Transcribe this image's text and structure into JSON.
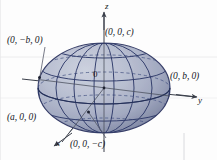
{
  "figure": {
    "kind": "ellipsoid-3d-coordinate-diagram",
    "background_color": "#fdfdfd",
    "surface_color_light": "#c3c8d8",
    "surface_color_mid": "#a7adc4",
    "surface_color_dark": "#6f7794",
    "grid_color": "#2b3a6b",
    "axis_color": "#3a3f4a",
    "text_color": "#14161c",
    "edge_line_color": "#e3e3ea"
  },
  "axes": {
    "z": {
      "label": "z",
      "direction": "up"
    },
    "y": {
      "label": "y",
      "direction": "right"
    },
    "x": {
      "label": "x",
      "direction": "down-left"
    },
    "origin_label": "0"
  },
  "point_labels": {
    "neg_b": "(0, −b, 0)",
    "pos_c": "(0, 0, c)",
    "pos_b": "(0, b, 0)",
    "pos_a": "(a, 0, 0)",
    "neg_c": "(0, 0, −c)"
  },
  "geometry": {
    "center": {
      "cx": 104,
      "cy": 88
    },
    "semi_axis_horizontal": 66,
    "semi_axis_vertical": 45,
    "meridian_count": 7,
    "latitude_count": 5
  }
}
